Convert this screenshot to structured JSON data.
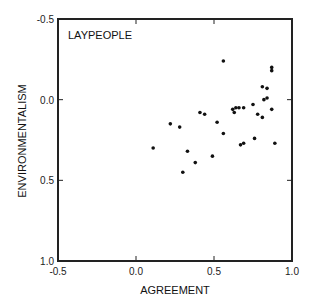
{
  "chart_data": {
    "type": "scatter",
    "title": "",
    "panel_label": "LAYPEOPLE",
    "xlabel": "AGREEMENT",
    "ylabel": "ENVIRONMENTALISM",
    "xlim": [
      -0.5,
      1.0
    ],
    "ylim": [
      -0.5,
      1.0
    ],
    "y_inverted": true,
    "grid": false,
    "legend": null,
    "x_ticks": [
      -0.5,
      0.0,
      0.5,
      1.0
    ],
    "x_tick_labels": [
      "-0.5",
      "0.0",
      "0.5",
      "1.0"
    ],
    "y_ticks": [
      -0.5,
      0.0,
      0.5,
      1.0
    ],
    "y_tick_labels": [
      "-0.5",
      "0.0",
      "0.5",
      "1.0"
    ],
    "series": [
      {
        "name": "LAYPEOPLE",
        "color": "#111111",
        "points": [
          {
            "x": 0.11,
            "y": 0.3
          },
          {
            "x": 0.22,
            "y": 0.15
          },
          {
            "x": 0.28,
            "y": 0.17
          },
          {
            "x": 0.3,
            "y": 0.45
          },
          {
            "x": 0.33,
            "y": 0.32
          },
          {
            "x": 0.38,
            "y": 0.39
          },
          {
            "x": 0.41,
            "y": 0.08
          },
          {
            "x": 0.44,
            "y": 0.09
          },
          {
            "x": 0.49,
            "y": 0.35
          },
          {
            "x": 0.52,
            "y": 0.14
          },
          {
            "x": 0.56,
            "y": 0.21
          },
          {
            "x": 0.56,
            "y": -0.24
          },
          {
            "x": 0.62,
            "y": 0.06
          },
          {
            "x": 0.64,
            "y": 0.05
          },
          {
            "x": 0.66,
            "y": 0.05
          },
          {
            "x": 0.69,
            "y": 0.05
          },
          {
            "x": 0.63,
            "y": 0.08
          },
          {
            "x": 0.67,
            "y": 0.28
          },
          {
            "x": 0.69,
            "y": 0.27
          },
          {
            "x": 0.75,
            "y": 0.03
          },
          {
            "x": 0.76,
            "y": 0.24
          },
          {
            "x": 0.78,
            "y": 0.09
          },
          {
            "x": 0.81,
            "y": 0.11
          },
          {
            "x": 0.81,
            "y": -0.08
          },
          {
            "x": 0.82,
            "y": 0.0
          },
          {
            "x": 0.84,
            "y": -0.07
          },
          {
            "x": 0.84,
            "y": -0.01
          },
          {
            "x": 0.87,
            "y": -0.2
          },
          {
            "x": 0.87,
            "y": -0.18
          },
          {
            "x": 0.87,
            "y": 0.06
          },
          {
            "x": 0.89,
            "y": 0.27
          }
        ]
      }
    ]
  }
}
